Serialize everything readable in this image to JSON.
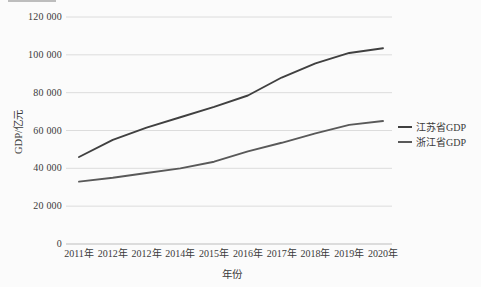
{
  "chart_data": {
    "type": "line",
    "title": "",
    "xlabel": "年份",
    "ylabel": "GDP/亿元",
    "categories": [
      "2011年",
      "2012年",
      "2012年",
      "2014年",
      "2015年",
      "2016年",
      "2017年",
      "2018年",
      "2019年",
      "2020年"
    ],
    "series": [
      {
        "name": "江苏省GDP",
        "color": "#404040",
        "values": [
          46000,
          55000,
          61500,
          67000,
          72500,
          78500,
          88000,
          95500,
          101000,
          103500
        ]
      },
      {
        "name": "浙江省GDP",
        "color": "#595959",
        "values": [
          33000,
          35000,
          37500,
          40000,
          43500,
          49000,
          53500,
          58500,
          63000,
          65000
        ]
      }
    ],
    "ylim": [
      0,
      120000
    ],
    "ytick_step": 20000,
    "ytick_labels": [
      "0",
      "20 000",
      "40 000",
      "60 000",
      "80 000",
      "100 000",
      "120 000"
    ],
    "grid": "horizontal",
    "legend_position": "right",
    "gridline_color": "#dcdcdc",
    "baseline_color": "#bdbdbd"
  }
}
